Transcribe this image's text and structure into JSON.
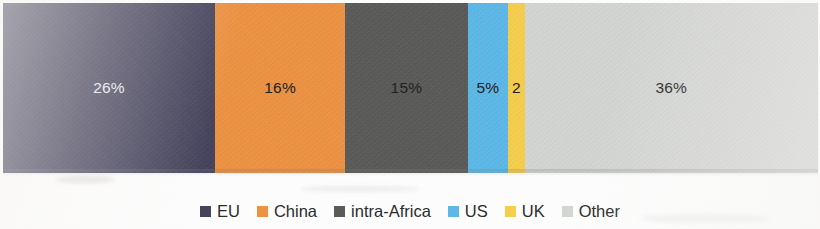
{
  "chart_data": {
    "type": "bar",
    "subtype": "100% stacked horizontal bar",
    "title": "",
    "subtitle": "",
    "xlabel": "",
    "ylabel": "",
    "categories": [
      "EU",
      "China",
      "intra-Africa",
      "US",
      "UK",
      "Other"
    ],
    "values": [
      26,
      16,
      15,
      5,
      2,
      36
    ],
    "value_labels": [
      "26%",
      "16%",
      "15%",
      "5%",
      "2",
      "36%"
    ],
    "value_unit": "%",
    "xlim": [
      0,
      100
    ],
    "grid": false,
    "axis_visible": false,
    "legend_position": "bottom-center",
    "legend_entries": [
      "EU",
      "China",
      "intra-Africa",
      "US",
      "UK",
      "Other"
    ],
    "colors": [
      "#45435c",
      "#ed9242",
      "#5a5a58",
      "#5cb8e8",
      "#f7ce4b",
      "#d4d6d4"
    ],
    "label_colors": [
      "#e9e9ee",
      "#20201f",
      "#20201f",
      "#20201f",
      "#20201f",
      "#20201f"
    ],
    "annotations": []
  },
  "bar": {
    "segments": [
      {
        "name": "EU",
        "label": "26%",
        "percent": 26,
        "color": "#45435c",
        "label_color": "light"
      },
      {
        "name": "China",
        "label": "16%",
        "percent": 16,
        "color": "#ed9242",
        "label_color": "dark"
      },
      {
        "name": "intra-Africa",
        "label": "15%",
        "percent": 15,
        "color": "#5a5a58",
        "label_color": "dark"
      },
      {
        "name": "US",
        "label": "5%",
        "percent": 5,
        "color": "#5cb8e8",
        "label_color": "dark"
      },
      {
        "name": "UK",
        "label": "2",
        "percent": 2,
        "color": "#f7ce4b",
        "label_color": "dark"
      },
      {
        "name": "Other",
        "label": "36%",
        "percent": 36,
        "color": "#d4d6d4",
        "label_color": "dark"
      }
    ]
  },
  "legend": {
    "items": [
      {
        "label": "EU",
        "color": "#45435c"
      },
      {
        "label": "China",
        "color": "#ed9242"
      },
      {
        "label": "intra-Africa",
        "color": "#5a5a58"
      },
      {
        "label": "US",
        "color": "#5cb8e8"
      },
      {
        "label": "UK",
        "color": "#f7ce4b"
      },
      {
        "label": "Other",
        "color": "#d4d6d4"
      }
    ]
  }
}
